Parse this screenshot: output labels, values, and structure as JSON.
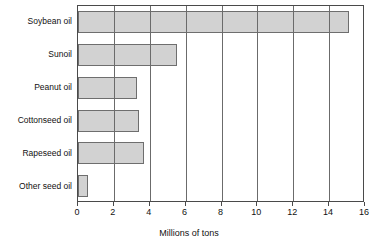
{
  "chart_data": {
    "type": "bar",
    "orientation": "horizontal",
    "title": "",
    "xlabel": "Millions of tons",
    "ylabel": "",
    "categories": [
      "Soybean oil",
      "Sunoil",
      "Peanut oil",
      "Cottonseed oil",
      "Rapeseed oil",
      "Other seed oil"
    ],
    "values": [
      15.1,
      5.5,
      3.3,
      3.4,
      3.7,
      0.55
    ],
    "xlim": [
      0,
      16
    ],
    "xticks": [
      0,
      2,
      4,
      6,
      8,
      10,
      12,
      14,
      16
    ],
    "xtick_labels": [
      "0",
      "2",
      "4",
      "6",
      "8",
      "10",
      "12",
      "14",
      "16"
    ],
    "grid": "vertical",
    "legend": "none",
    "bar_fill_color": "#d2d2d2",
    "bar_border_color": "#6e6e6e",
    "gridline_color": "#6b6b6b",
    "axis_color": "#4a4a4a",
    "background_color": "#ffffff"
  }
}
